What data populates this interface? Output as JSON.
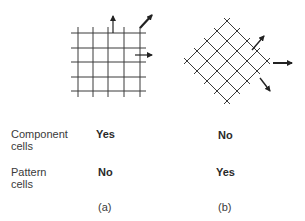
{
  "diagram": {
    "panel_a": {
      "caption": "(a)",
      "description": "square grid with arrows pointing up, diagonally up-right, and right",
      "grid": {
        "vertical_lines": 5,
        "horizontal_lines": 5
      },
      "arrows": [
        "up",
        "up-right",
        "right"
      ]
    },
    "panel_b": {
      "caption": "(b)",
      "description": "diagonal (rotated 45°) lattice with arrows pointing up-right, right, and down-right",
      "arrows": [
        "up-right",
        "right",
        "down-right"
      ]
    }
  },
  "table": {
    "rows": [
      {
        "label_line1": "Component",
        "label_line2": "cells",
        "a": "Yes",
        "b": "No"
      },
      {
        "label_line1": "Pattern",
        "label_line2": "cells",
        "a": "No",
        "b": "Yes"
      }
    ]
  },
  "colors": {
    "line": "#3a3a3a",
    "text": "#2a2a2a"
  }
}
